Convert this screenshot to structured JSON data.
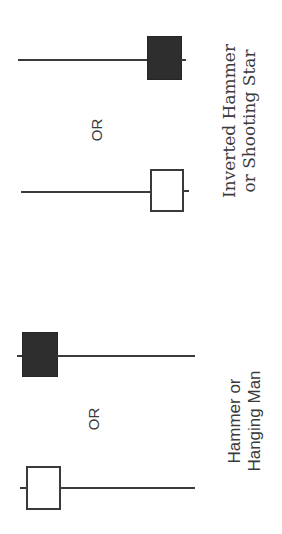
{
  "diagram": {
    "groups": [
      {
        "id": "inverted",
        "label_line1": "Inverted Hammer",
        "label_line2": "or Shooting Star",
        "separator": "OR",
        "candles": [
          {
            "type": "bearish",
            "fill": "#2e2e2e",
            "body": "short-at-lower-end",
            "shadow": "long-upper"
          },
          {
            "type": "bullish",
            "fill": "#ffffff",
            "body": "short-at-lower-end",
            "shadow": "long-upper"
          }
        ]
      },
      {
        "id": "hammer",
        "label_line1": "Hammer or",
        "label_line2": "Hanging Man",
        "separator": "OR",
        "candles": [
          {
            "type": "bearish",
            "fill": "#2e2e2e",
            "body": "short-at-upper-end",
            "shadow": "long-lower"
          },
          {
            "type": "bullish",
            "fill": "#ffffff",
            "body": "short-at-upper-end",
            "shadow": "long-lower"
          }
        ]
      }
    ],
    "colors": {
      "ink": "#3a3a3a",
      "dark_body": "#2e2e2e",
      "background": "#ffffff"
    }
  }
}
